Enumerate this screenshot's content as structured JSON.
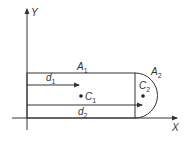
{
  "diagram": {
    "axes": {
      "x_label": "X",
      "y_label": "Y"
    },
    "regions": [
      {
        "id": "A1",
        "label": "A",
        "subscript": "1",
        "shape": "rectangle"
      },
      {
        "id": "A2",
        "label": "A",
        "subscript": "2",
        "shape": "semicircle"
      }
    ],
    "centroids": [
      {
        "id": "C1",
        "label": "C",
        "subscript": "1"
      },
      {
        "id": "C2",
        "label": "C",
        "subscript": "2"
      }
    ],
    "distances": [
      {
        "id": "d1",
        "label": "d",
        "subscript": "1"
      },
      {
        "id": "d2",
        "label": "d",
        "subscript": "2"
      }
    ],
    "colors": {
      "line": "#333333",
      "background": "#ffffff"
    }
  }
}
